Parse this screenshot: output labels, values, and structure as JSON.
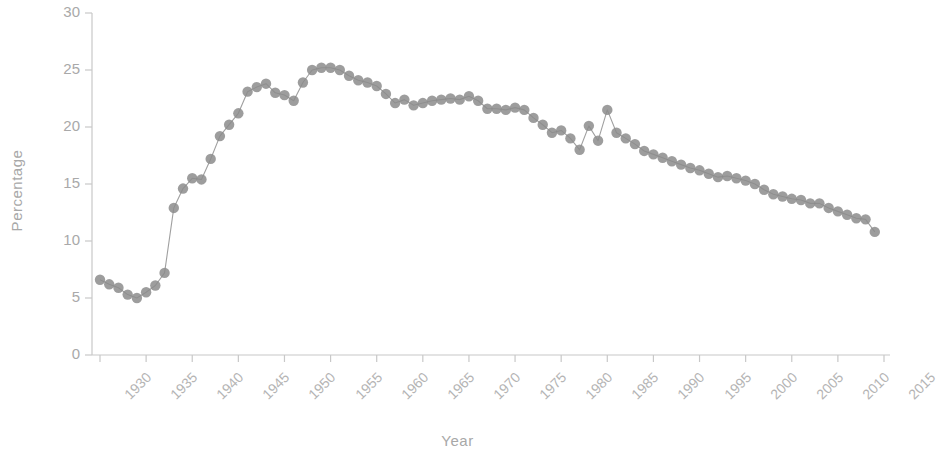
{
  "chart_data": {
    "type": "line",
    "title": "",
    "subtitle": "",
    "xlabel": "Year",
    "ylabel": "Percentage",
    "xlim": [
      1928,
      2016
    ],
    "ylim": [
      0,
      30
    ],
    "grid": false,
    "legend": null,
    "legend_position": "none",
    "marker": "circle",
    "marker_color": "#8c8c8c",
    "line_color": "#a0a0a0",
    "axis_color": "#c8c8c8",
    "tick_label_color": "#b0b0b0",
    "xticks": [
      1930,
      1935,
      1940,
      1945,
      1950,
      1955,
      1960,
      1965,
      1970,
      1975,
      1980,
      1985,
      1990,
      1995,
      2000,
      2005,
      2010,
      2015
    ],
    "xtick_labels": [
      "1930",
      "1935",
      "1940",
      "1945",
      "1950",
      "1955",
      "1960",
      "1965",
      "1970",
      "1975",
      "1980",
      "1985",
      "1990",
      "1995",
      "2000",
      "2005",
      "2010",
      "2015"
    ],
    "yticks": [
      0,
      5,
      10,
      15,
      20,
      25,
      30
    ],
    "ytick_labels": [
      "0",
      "5",
      "10",
      "15",
      "20",
      "25",
      "30"
    ],
    "series": [
      {
        "name": "Percentage",
        "x": [
          1930,
          1931,
          1932,
          1933,
          1934,
          1935,
          1936,
          1937,
          1938,
          1939,
          1940,
          1941,
          1942,
          1943,
          1944,
          1945,
          1946,
          1947,
          1948,
          1949,
          1950,
          1951,
          1952,
          1953,
          1954,
          1955,
          1956,
          1957,
          1958,
          1959,
          1960,
          1961,
          1962,
          1963,
          1964,
          1965,
          1966,
          1967,
          1968,
          1969,
          1970,
          1971,
          1972,
          1973,
          1974,
          1975,
          1976,
          1977,
          1978,
          1979,
          1980,
          1981,
          1982,
          1983,
          1984,
          1985,
          1986,
          1987,
          1988,
          1989,
          1990,
          1991,
          1992,
          1993,
          1994,
          1995,
          1996,
          1997,
          1998,
          1999,
          2000,
          2001,
          2002,
          2003,
          2004,
          2005,
          2006,
          2007,
          2008,
          2009,
          2010,
          2011,
          2012,
          2013,
          2014
        ],
        "y": [
          6.6,
          6.2,
          5.9,
          5.3,
          5.0,
          5.5,
          6.1,
          7.2,
          12.9,
          14.6,
          15.5,
          15.4,
          17.2,
          19.2,
          20.2,
          21.2,
          23.1,
          23.5,
          23.8,
          23.0,
          22.8,
          22.3,
          23.9,
          25.0,
          25.2,
          25.2,
          25.0,
          24.5,
          24.1,
          23.9,
          23.6,
          22.9,
          22.1,
          22.4,
          21.9,
          22.1,
          22.3,
          22.4,
          22.5,
          22.4,
          22.7,
          22.3,
          21.6,
          21.6,
          21.5,
          21.7,
          21.5,
          20.8,
          20.2,
          19.5,
          19.7,
          19.0,
          18.0,
          20.1,
          18.8,
          21.5,
          19.5,
          19.0,
          18.5,
          17.9,
          17.6,
          17.3,
          17.0,
          16.7,
          16.4,
          16.2,
          15.9,
          15.6,
          15.7,
          15.5,
          15.3,
          15.0,
          14.5,
          14.1,
          13.9,
          13.7,
          13.6,
          13.3,
          13.3,
          12.9,
          12.6,
          12.3,
          12.0,
          11.9,
          10.8
        ]
      }
    ]
  }
}
